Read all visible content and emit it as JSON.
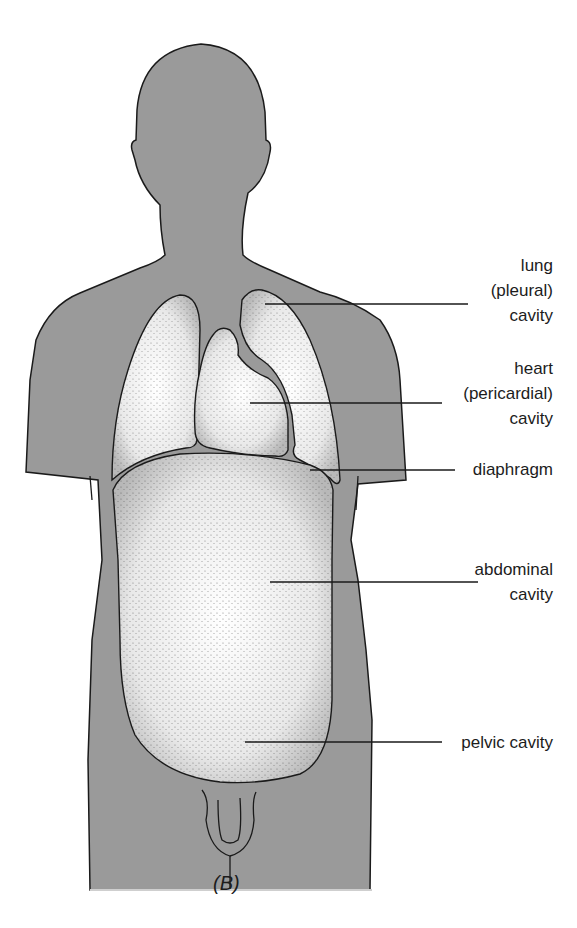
{
  "figure": {
    "caption": "(B)",
    "colors": {
      "body_fill": "#9a9a9a",
      "outline": "#1a1a1a",
      "cavity_fill": "#ffffff",
      "stipple": "#2a2a2a",
      "background": "#ffffff"
    }
  },
  "labels": [
    {
      "id": "lung",
      "text": "lung\n(pleural)\ncavity"
    },
    {
      "id": "heart",
      "text": "heart\n(pericardial)\ncavity"
    },
    {
      "id": "diaphragm",
      "text": "diaphragm"
    },
    {
      "id": "abdominal",
      "text": "abdominal\ncavity"
    },
    {
      "id": "pelvic",
      "text": "pelvic cavity"
    }
  ]
}
